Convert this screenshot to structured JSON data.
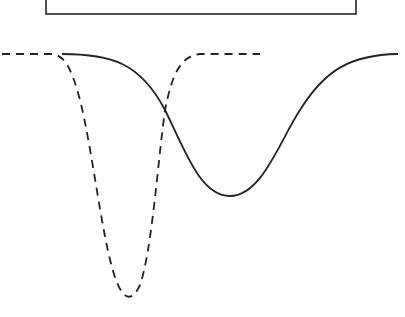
{
  "diagram": {
    "box": {
      "x": 46,
      "y": -2,
      "width": 310,
      "height": 16
    },
    "curves": [
      {
        "name": "narrow-deep-dip",
        "style": "dashed",
        "baseline_y": 54,
        "min_point": [
          128,
          295
        ]
      },
      {
        "name": "wide-shallow-dip",
        "style": "solid",
        "baseline_y": 54,
        "min_point": [
          230,
          196
        ]
      }
    ],
    "stroke_color": "#222222",
    "background": "#ffffff"
  }
}
